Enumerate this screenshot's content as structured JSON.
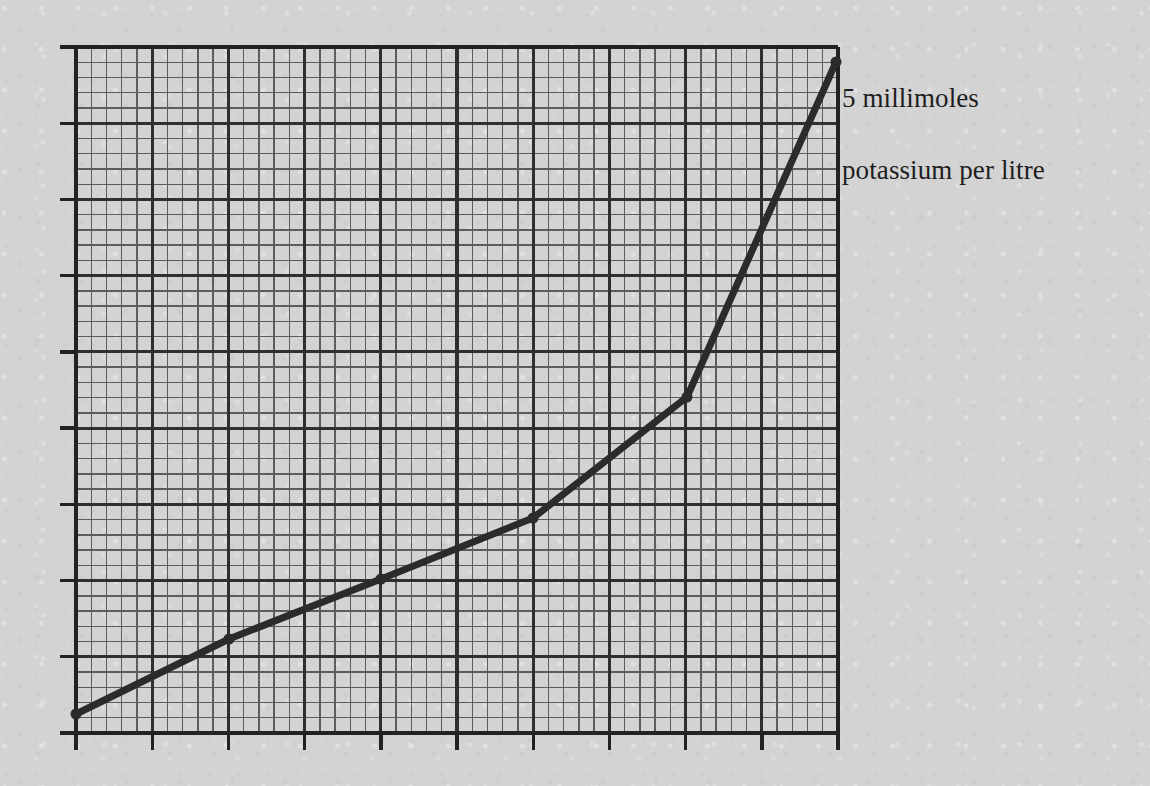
{
  "figure": {
    "background_color": "#d3d3d3",
    "ink_color": "#2b2b2b",
    "annotation": {
      "line1": "5 millimoles",
      "line2": "potassium per litre"
    }
  },
  "chart_data": {
    "type": "line",
    "title": "",
    "subtitle": "",
    "xlabel": "",
    "ylabel": "",
    "annotations": [
      {
        "text": "5 millimoles potassium per litre",
        "attached_to_point_index": 5,
        "position": "right-of-final-point"
      }
    ],
    "legend": [],
    "legend_position": "none",
    "grid": {
      "enabled": true,
      "major_gridlines": true,
      "minor_gridlines": true,
      "minor_per_major": 5,
      "major_columns": 10,
      "major_rows": 9,
      "major_spacing_px": 76.2,
      "minor_spacing_px": 15.24,
      "tick_marks": "outside on left and bottom axes at major gridlines"
    },
    "axes": {
      "xlim": [
        0,
        10
      ],
      "ylim": [
        0,
        9
      ],
      "x_tick_labels": [],
      "y_tick_labels": [],
      "plot_left_px": 76,
      "plot_right_px": 838,
      "plot_top_px": 47,
      "plot_bottom_px": 733
    },
    "x": [
      0,
      2,
      4,
      6,
      8,
      9.97
    ],
    "y": [
      0.25,
      1.23,
      2.02,
      2.82,
      4.41,
      8.8
    ],
    "points_px": [
      {
        "x": 76,
        "y": 714
      },
      {
        "x": 229,
        "y": 639
      },
      {
        "x": 381,
        "y": 579
      },
      {
        "x": 533,
        "y": 518
      },
      {
        "x": 687,
        "y": 397
      },
      {
        "x": 836,
        "y": 62
      }
    ],
    "marker": "filled-circle",
    "marker_size_px": 11,
    "line_width_px": 7,
    "line_color": "#2b2b2b",
    "series": [
      {
        "name": "potassium concentration curve",
        "values": [
          0.25,
          1.23,
          2.02,
          2.82,
          4.41,
          8.8
        ]
      }
    ]
  }
}
